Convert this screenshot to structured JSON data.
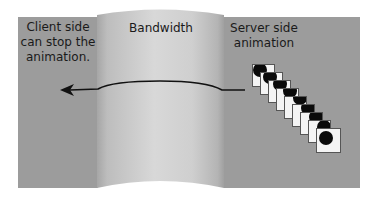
{
  "labels": {
    "client": "Client side can stop the animation.",
    "bandwidth": "Bandwidth",
    "server": "Server side animation"
  },
  "colors": {
    "panel": "#9c9c9c",
    "cylinder_light": "#d6d6d6",
    "cylinder_dark": "#a9a9a9",
    "arrow": "#111111",
    "card": "#f4f4f4",
    "dot": "#0a0a0a"
  },
  "animation_frames": {
    "count": 9,
    "icon": "ball-frame-icon"
  },
  "arrow": {
    "direction": "server-to-client"
  }
}
